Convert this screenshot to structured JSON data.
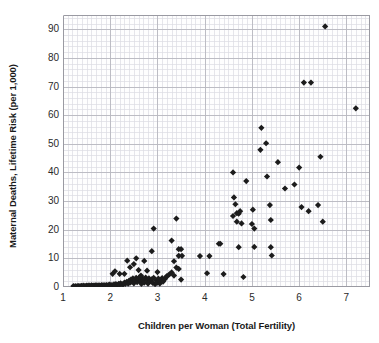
{
  "chart_data": {
    "type": "scatter",
    "title": "",
    "xlabel": "Children per Woman (Total Fertility)",
    "ylabel": "Maternal Deaths, Lifetime Risk (per 1,000)",
    "xlim": [
      1,
      7.5
    ],
    "ylim": [
      0,
      95
    ],
    "xticks": [
      1,
      2,
      3,
      4,
      5,
      6,
      7
    ],
    "yticks": [
      0,
      10,
      20,
      30,
      40,
      50,
      60,
      70,
      80,
      90
    ],
    "xtick_labels": [
      "1",
      "2",
      "3",
      "4",
      "5",
      "6",
      "7"
    ],
    "ytick_labels": [
      "0",
      "10",
      "20",
      "30",
      "40",
      "50",
      "60",
      "70",
      "80",
      "90"
    ],
    "grid": true,
    "minor_grid": true,
    "minor_grid_step_x": 0.1,
    "minor_grid_step_y": 2,
    "legend": false,
    "marker": "diamond",
    "marker_color": "#1c1c1c",
    "marker_size": 3.1,
    "grid_major_color": "#b8b8c0",
    "grid_minor_color": "#dcdce2",
    "axis_color": "#9a9aa2",
    "background": "#ffffff",
    "points": [
      [
        1.22,
        0.35
      ],
      [
        1.26,
        0.3
      ],
      [
        1.3,
        0.3
      ],
      [
        1.33,
        0.35
      ],
      [
        1.36,
        0.3
      ],
      [
        1.39,
        0.4
      ],
      [
        1.42,
        0.3
      ],
      [
        1.44,
        0.45
      ],
      [
        1.47,
        0.35
      ],
      [
        1.5,
        0.5
      ],
      [
        1.52,
        0.3
      ],
      [
        1.55,
        0.55
      ],
      [
        1.57,
        0.35
      ],
      [
        1.6,
        0.6
      ],
      [
        1.62,
        0.4
      ],
      [
        1.64,
        0.5
      ],
      [
        1.66,
        0.35
      ],
      [
        1.68,
        0.6
      ],
      [
        1.7,
        0.45
      ],
      [
        1.72,
        0.55
      ],
      [
        1.74,
        0.35
      ],
      [
        1.76,
        0.6
      ],
      [
        1.78,
        0.5
      ],
      [
        1.8,
        0.4
      ],
      [
        1.82,
        0.65
      ],
      [
        1.84,
        0.45
      ],
      [
        1.86,
        0.55
      ],
      [
        1.88,
        0.6
      ],
      [
        1.9,
        0.5
      ],
      [
        1.92,
        0.7
      ],
      [
        1.94,
        0.45
      ],
      [
        1.96,
        0.6
      ],
      [
        1.98,
        0.8
      ],
      [
        2.0,
        0.55
      ],
      [
        2.02,
        0.7
      ],
      [
        2.05,
        0.6
      ],
      [
        2.08,
        0.9
      ],
      [
        2.1,
        0.65
      ],
      [
        2.12,
        1.0
      ],
      [
        2.15,
        0.7
      ],
      [
        2.18,
        1.1
      ],
      [
        2.2,
        0.8
      ],
      [
        2.22,
        1.3
      ],
      [
        2.25,
        0.9
      ],
      [
        2.28,
        1.0
      ],
      [
        2.3,
        1.5
      ],
      [
        2.32,
        1.1
      ],
      [
        2.35,
        1.8
      ],
      [
        2.38,
        1.2
      ],
      [
        2.4,
        2.2
      ],
      [
        2.42,
        1.5
      ],
      [
        2.44,
        2.6
      ],
      [
        2.46,
        1.9
      ],
      [
        2.48,
        3.0
      ],
      [
        2.5,
        1.3
      ],
      [
        2.52,
        2.4
      ],
      [
        2.55,
        3.2
      ],
      [
        2.57,
        1.7
      ],
      [
        2.6,
        2.8
      ],
      [
        2.62,
        3.4
      ],
      [
        2.64,
        2.0
      ],
      [
        2.66,
        1.1
      ],
      [
        2.68,
        3.1
      ],
      [
        2.7,
        2.3
      ],
      [
        2.72,
        1.5
      ],
      [
        2.75,
        3.3
      ],
      [
        2.78,
        2.5
      ],
      [
        2.8,
        1.2
      ],
      [
        2.82,
        3.0
      ],
      [
        2.85,
        2.0
      ],
      [
        2.88,
        2.7
      ],
      [
        2.9,
        1.4
      ],
      [
        2.92,
        3.2
      ],
      [
        2.95,
        1.0
      ],
      [
        2.98,
        2.2
      ],
      [
        3.0,
        1.6
      ],
      [
        3.02,
        2.9
      ],
      [
        3.05,
        1.2
      ],
      [
        3.08,
        2.4
      ],
      [
        3.1,
        3.1
      ],
      [
        3.12,
        1.9
      ],
      [
        3.15,
        2.7
      ],
      [
        3.18,
        3.3
      ],
      [
        3.2,
        3.8
      ],
      [
        3.25,
        4.4
      ],
      [
        3.3,
        5.1
      ],
      [
        3.35,
        4.0
      ],
      [
        3.4,
        6.8
      ],
      [
        3.45,
        6.3
      ],
      [
        3.5,
        2.6
      ],
      [
        2.05,
        4.6
      ],
      [
        2.1,
        5.5
      ],
      [
        2.2,
        4.6
      ],
      [
        2.3,
        4.6
      ],
      [
        2.36,
        9.2
      ],
      [
        2.42,
        6.9
      ],
      [
        2.5,
        8.0
      ],
      [
        2.55,
        10.0
      ],
      [
        2.6,
        5.9
      ],
      [
        2.65,
        4.0
      ],
      [
        2.72,
        9.1
      ],
      [
        2.78,
        5.7
      ],
      [
        2.88,
        12.5
      ],
      [
        2.92,
        20.4
      ],
      [
        3.0,
        5.2
      ],
      [
        3.3,
        16.2
      ],
      [
        3.35,
        9.0
      ],
      [
        3.4,
        23.9
      ],
      [
        3.45,
        13.2
      ],
      [
        3.5,
        13.2
      ],
      [
        3.45,
        10.9
      ],
      [
        3.52,
        10.9
      ],
      [
        3.9,
        10.8
      ],
      [
        4.1,
        10.8
      ],
      [
        4.05,
        4.8
      ],
      [
        4.3,
        15.1
      ],
      [
        4.33,
        15.1
      ],
      [
        4.4,
        4.5
      ],
      [
        4.6,
        40.0
      ],
      [
        4.6,
        24.8
      ],
      [
        4.62,
        31.3
      ],
      [
        4.65,
        28.9
      ],
      [
        4.68,
        25.8
      ],
      [
        4.68,
        22.8
      ],
      [
        4.72,
        25.6
      ],
      [
        4.75,
        26.5
      ],
      [
        4.78,
        22.2
      ],
      [
        4.72,
        13.9
      ],
      [
        4.82,
        3.5
      ],
      [
        4.88,
        37.0
      ],
      [
        5.0,
        22.0
      ],
      [
        5.02,
        27.0
      ],
      [
        5.05,
        20.4
      ],
      [
        5.05,
        14.0
      ],
      [
        5.18,
        47.9
      ],
      [
        5.2,
        55.6
      ],
      [
        5.3,
        50.2
      ],
      [
        5.32,
        38.6
      ],
      [
        5.38,
        28.6
      ],
      [
        5.4,
        23.4
      ],
      [
        5.4,
        13.9
      ],
      [
        5.42,
        11.0
      ],
      [
        5.55,
        43.6
      ],
      [
        5.7,
        34.4
      ],
      [
        5.9,
        35.8
      ],
      [
        6.0,
        41.7
      ],
      [
        6.05,
        27.9
      ],
      [
        6.1,
        71.4
      ],
      [
        6.2,
        26.5
      ],
      [
        6.25,
        71.4
      ],
      [
        6.4,
        28.6
      ],
      [
        6.45,
        45.5
      ],
      [
        6.5,
        22.8
      ],
      [
        6.55,
        91.0
      ],
      [
        7.2,
        62.4
      ]
    ]
  },
  "axes": {
    "x_title": "Children per Woman (Total Fertility)",
    "y_title": "Maternal Deaths, Lifetime Risk (per 1,000)"
  },
  "clipped_header": ""
}
